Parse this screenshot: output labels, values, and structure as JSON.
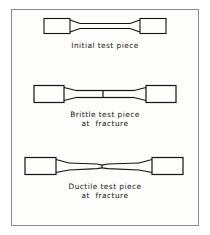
{
  "figure": {
    "border_color": "#8a8a8a",
    "background_color": "#fdfdfb",
    "ink_color": "#15130f",
    "specimens": [
      {
        "id": "initial",
        "caption_line_1": "Initial test piece",
        "caption_line_2": "",
        "state": "unbroken",
        "fractured": false,
        "necked": false,
        "total_length_px": 122,
        "grip_width_px": 26,
        "grip_height_px": 15,
        "gauge_height_px": 5,
        "shoulder_length_px": 10
      },
      {
        "id": "brittle",
        "caption_line_1": "Brittle test piece",
        "caption_line_2": "at  fracture",
        "state": "fractured-flat",
        "fractured": true,
        "necked": false,
        "total_length_px": 140,
        "grip_width_px": 30,
        "grip_height_px": 17,
        "gauge_height_px": 7,
        "shoulder_length_px": 12,
        "fracture_type": "flat square break, no reduction of area"
      },
      {
        "id": "ductile",
        "caption_line_1": "Ductile test piece",
        "caption_line_2": "at  fracture",
        "state": "fractured-necked",
        "fractured": true,
        "necked": true,
        "total_length_px": 158,
        "grip_width_px": 31,
        "grip_height_px": 17,
        "gauge_height_px": 8,
        "neck_height_px": 3,
        "shoulder_length_px": 13,
        "fracture_type": "cup and cone break with necking"
      }
    ]
  }
}
